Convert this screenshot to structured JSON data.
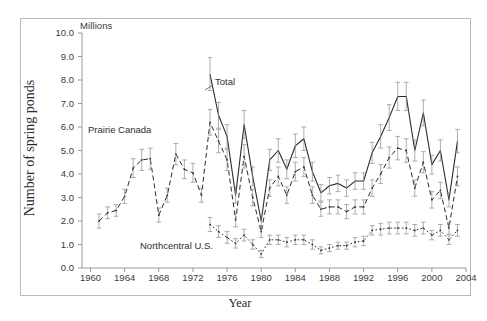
{
  "figure": {
    "unit_label": "Millions",
    "ylabel": "Number of spring ponds",
    "xlabel": "Year"
  },
  "annotations": {
    "prairie": "Prairie Canada",
    "total": "Total",
    "northcentral": "Northcentral U.S."
  },
  "chart_data": {
    "type": "line",
    "title": "",
    "xlabel": "Year",
    "ylabel": "Number of spring ponds",
    "unit": "Millions",
    "xlim": [
      1959,
      2004
    ],
    "ylim": [
      0.0,
      10.0
    ],
    "grid": false,
    "legend": "inline-annotations",
    "yticks": [
      "0.0",
      "1.0",
      "2.0",
      "3.0",
      "4.0",
      "5.0",
      "6.0",
      "7.0",
      "8.0",
      "9.0",
      "10.0"
    ],
    "xticks": [
      "1960",
      "1964",
      "1968",
      "1972",
      "1976",
      "1980",
      "1984",
      "1988",
      "1992",
      "1996",
      "2000",
      "2004"
    ],
    "x": [
      1961,
      1962,
      1963,
      1964,
      1965,
      1966,
      1967,
      1968,
      1969,
      1970,
      1971,
      1972,
      1973,
      1974,
      1975,
      1976,
      1977,
      1978,
      1979,
      1980,
      1981,
      1982,
      1983,
      1984,
      1985,
      1986,
      1987,
      1988,
      1989,
      1990,
      1991,
      1992,
      1993,
      1994,
      1995,
      1996,
      1997,
      1998,
      1999,
      2000,
      2001,
      2002,
      2003
    ],
    "series": [
      {
        "name": "Total",
        "style": "solid",
        "values": [
          null,
          null,
          null,
          null,
          null,
          null,
          null,
          null,
          null,
          null,
          null,
          null,
          null,
          8.25,
          6.5,
          5.6,
          3.1,
          6.1,
          3.9,
          2.0,
          4.6,
          5.0,
          4.2,
          5.2,
          5.5,
          4.1,
          3.2,
          3.5,
          3.6,
          3.4,
          3.7,
          3.7,
          4.9,
          5.6,
          6.4,
          7.3,
          7.3,
          5.0,
          6.6,
          4.4,
          5.0,
          2.9,
          5.4
        ],
        "errors": [
          null,
          null,
          null,
          null,
          null,
          null,
          null,
          null,
          null,
          null,
          null,
          null,
          null,
          0.7,
          0.55,
          0.5,
          0.35,
          0.6,
          0.4,
          0.3,
          0.45,
          0.5,
          0.4,
          0.5,
          0.5,
          0.4,
          0.35,
          0.35,
          0.35,
          0.35,
          0.35,
          0.35,
          0.45,
          0.5,
          0.55,
          0.6,
          0.6,
          0.45,
          0.55,
          0.4,
          0.45,
          0.3,
          0.5
        ]
      },
      {
        "name": "Prairie Canada",
        "style": "dashed",
        "values": [
          2.0,
          2.35,
          2.45,
          3.05,
          4.25,
          4.6,
          4.65,
          2.25,
          3.1,
          4.85,
          4.2,
          4.05,
          3.1,
          6.2,
          5.4,
          4.6,
          2.05,
          4.75,
          3.0,
          1.55,
          3.4,
          3.9,
          3.1,
          4.1,
          4.3,
          3.1,
          2.5,
          2.6,
          2.6,
          2.4,
          2.6,
          2.6,
          3.4,
          4.0,
          4.7,
          5.1,
          5.0,
          3.4,
          4.5,
          2.9,
          3.3,
          1.7,
          3.9
        ],
        "errors": [
          0.3,
          0.25,
          0.25,
          0.3,
          0.4,
          0.45,
          0.45,
          0.3,
          0.3,
          0.45,
          0.4,
          0.4,
          0.3,
          0.55,
          0.5,
          0.45,
          0.3,
          0.5,
          0.35,
          0.25,
          0.35,
          0.4,
          0.35,
          0.4,
          0.4,
          0.35,
          0.3,
          0.3,
          0.3,
          0.3,
          0.3,
          0.3,
          0.35,
          0.4,
          0.45,
          0.5,
          0.5,
          0.35,
          0.45,
          0.35,
          0.35,
          0.25,
          0.4
        ]
      },
      {
        "name": "Northcentral U.S.",
        "style": "dotted",
        "values": [
          null,
          null,
          null,
          null,
          null,
          null,
          null,
          null,
          null,
          null,
          null,
          null,
          null,
          1.85,
          1.55,
          1.3,
          1.05,
          1.4,
          1.0,
          0.6,
          1.2,
          1.2,
          1.1,
          1.2,
          1.2,
          1.0,
          0.75,
          0.85,
          0.95,
          0.95,
          1.1,
          1.15,
          1.6,
          1.65,
          1.7,
          1.7,
          1.7,
          1.6,
          1.7,
          1.4,
          1.6,
          1.2,
          1.6
        ],
        "errors": [
          null,
          null,
          null,
          null,
          null,
          null,
          null,
          null,
          null,
          null,
          null,
          null,
          null,
          0.3,
          0.25,
          0.25,
          0.2,
          0.25,
          0.2,
          0.15,
          0.2,
          0.2,
          0.2,
          0.2,
          0.2,
          0.2,
          0.15,
          0.15,
          0.15,
          0.15,
          0.2,
          0.2,
          0.2,
          0.25,
          0.25,
          0.25,
          0.25,
          0.25,
          0.25,
          0.2,
          0.25,
          0.2,
          0.25
        ]
      }
    ]
  }
}
